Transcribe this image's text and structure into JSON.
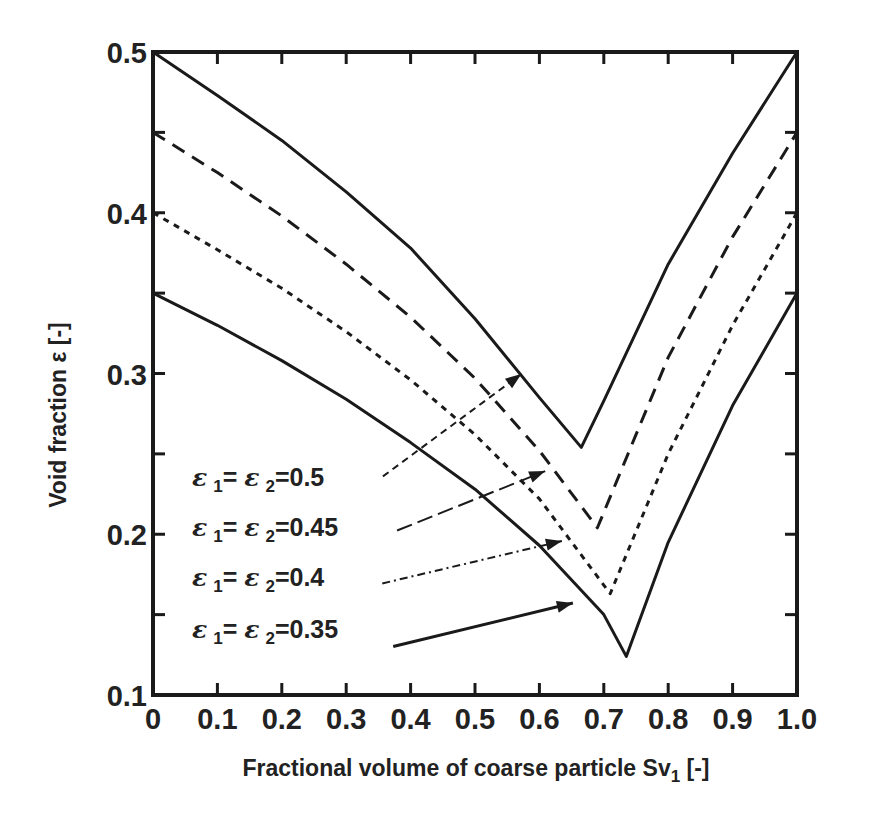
{
  "chart_data": {
    "type": "line",
    "title": "",
    "xlabel": "Fractional volume of coarse particle Sv₁ [-]",
    "xlabel_main": "Fractional volume of coarse particle Sv",
    "xlabel_sub": "1",
    "xlabel_unit": " [-]",
    "ylabel": "Void fraction  ε  [-]",
    "xlim": [
      0,
      1.0
    ],
    "ylim": [
      0.1,
      0.5
    ],
    "grid": false,
    "legend_position": "inside-lower-left (annotations with arrows)",
    "x_ticks": [
      "0",
      "0.1",
      "0.2",
      "0.3",
      "0.4",
      "0.5",
      "0.6",
      "0.7",
      "0.8",
      "0.9",
      "1.0"
    ],
    "y_ticks": [
      "0.1",
      "0.2",
      "0.3",
      "0.4",
      "0.5"
    ],
    "series": [
      {
        "name": "ε1 = ε2 = 0.5",
        "style": "solid",
        "x": [
          0,
          0.1,
          0.2,
          0.3,
          0.4,
          0.5,
          0.6,
          0.665,
          0.7,
          0.8,
          0.9,
          1.0
        ],
        "values": [
          0.5,
          0.473,
          0.445,
          0.413,
          0.378,
          0.334,
          0.285,
          0.254,
          0.283,
          0.368,
          0.437,
          0.5
        ]
      },
      {
        "name": "ε1 = ε2 = 0.45",
        "style": "dashed",
        "x": [
          0,
          0.1,
          0.2,
          0.3,
          0.4,
          0.5,
          0.6,
          0.69,
          0.75,
          0.8,
          0.9,
          1.0
        ],
        "values": [
          0.45,
          0.425,
          0.398,
          0.368,
          0.335,
          0.297,
          0.252,
          0.204,
          0.262,
          0.31,
          0.385,
          0.45
        ]
      },
      {
        "name": "ε1 = ε2 = 0.4",
        "style": "dotted",
        "x": [
          0,
          0.1,
          0.2,
          0.3,
          0.4,
          0.5,
          0.6,
          0.71,
          0.8,
          0.9,
          1.0
        ],
        "values": [
          0.4,
          0.377,
          0.353,
          0.326,
          0.296,
          0.262,
          0.222,
          0.163,
          0.25,
          0.33,
          0.4
        ]
      },
      {
        "name": "ε1 = ε2 = 0.35",
        "style": "solid",
        "x": [
          0,
          0.1,
          0.2,
          0.3,
          0.4,
          0.5,
          0.6,
          0.7,
          0.735,
          0.8,
          0.9,
          1.0
        ],
        "values": [
          0.35,
          0.33,
          0.308,
          0.284,
          0.257,
          0.228,
          0.193,
          0.15,
          0.124,
          0.195,
          0.28,
          0.35
        ]
      }
    ],
    "annotations": [
      {
        "text": "ε 1= ε 2=0.5",
        "eps_value": "0.5",
        "arrow_style": "dashed",
        "arrow_from": [
          0.357,
          0.236
        ],
        "arrow_to": [
          0.572,
          0.2997
        ]
      },
      {
        "text": "ε 1= ε 2=0.45",
        "eps_value": "0.45",
        "arrow_style": "dash-long",
        "arrow_from": [
          0.379,
          0.2023
        ],
        "arrow_to": [
          0.609,
          0.2393
        ]
      },
      {
        "text": "ε 1= ε 2=0.4",
        "eps_value": "0.4",
        "arrow_style": "dash-dot",
        "arrow_from": [
          0.356,
          0.1694
        ],
        "arrow_to": [
          0.635,
          0.1958
        ]
      },
      {
        "text": "ε 1= ε 2=0.35",
        "eps_value": "0.35",
        "arrow_style": "solid",
        "arrow_from": [
          0.373,
          0.1302
        ],
        "arrow_to": [
          0.652,
          0.1572
        ]
      }
    ]
  },
  "legend": [
    {
      "eps": "ε",
      "sub1": "1",
      "eq": "= ",
      "sub2": "2",
      "value": "=0.5"
    },
    {
      "eps": "ε",
      "sub1": "1",
      "eq": "= ",
      "sub2": "2",
      "value": "=0.45"
    },
    {
      "eps": "ε",
      "sub1": "1",
      "eq": "= ",
      "sub2": "2",
      "value": "=0.4"
    },
    {
      "eps": "ε",
      "sub1": "1",
      "eq": "= ",
      "sub2": "2",
      "value": "=0.35"
    }
  ],
  "colors": {
    "line": "#1a1a1a",
    "axis": "#1a1a1a",
    "text": "#222222",
    "background": "#ffffff"
  }
}
